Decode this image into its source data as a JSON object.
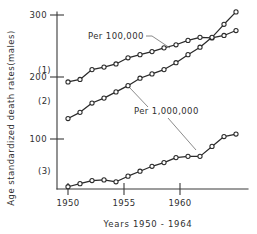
{
  "chart_data": {
    "type": "line",
    "title": "",
    "xlabel": "Years  1950 - 1964",
    "ylabel": "Age standardized death rates(males)",
    "xlim": [
      1949.3,
      1964.8
    ],
    "ylim": [
      0,
      315
    ],
    "xticks": [
      1950,
      1955,
      1960
    ],
    "xtick_labels": [
      "1950",
      "1955",
      "1960"
    ],
    "yticks": [
      100,
      200,
      300
    ],
    "ytick_labels": [
      "100",
      "200",
      "300"
    ],
    "grid": false,
    "legend": "none",
    "marker": "open-circle",
    "x": [
      1950,
      1951,
      1952,
      1953,
      1954,
      1955,
      1956,
      1957,
      1958,
      1959,
      1960,
      1961,
      1962,
      1963,
      1964
    ],
    "series": [
      {
        "name": "(1)",
        "label": "(1)",
        "units_annotation": "Per 100,000",
        "values": [
          192,
          196,
          212,
          216,
          221,
          231,
          236,
          241,
          247,
          252,
          259,
          264,
          263,
          267,
          275
        ]
      },
      {
        "name": "(2)",
        "label": "(2)",
        "units_annotation": "Per 1,000,000",
        "values": [
          133,
          143,
          158,
          166,
          176,
          186,
          198,
          205,
          212,
          223,
          236,
          248,
          264,
          285,
          305
        ]
      },
      {
        "name": "(3)",
        "label": "(3)",
        "units_annotation": "Per 1,000,000",
        "values": [
          23,
          28,
          33,
          34,
          31,
          40,
          48,
          56,
          62,
          70,
          72,
          72,
          88,
          104,
          108
        ]
      }
    ],
    "annotations": [
      {
        "text": "Per 100,000",
        "points_to": "(1)"
      },
      {
        "text": "Per 1,000,000",
        "points_to": "(2) and (3)"
      }
    ]
  },
  "axes": {
    "y_title": "Age standardized death rates(males)",
    "x_title": "Years  1950 - 1964"
  },
  "labels": {
    "series_1": "(1)",
    "series_2": "(2)",
    "series_3": "(3)",
    "anno_per_100000": "Per 100,000",
    "anno_per_1000000": "Per 1,000,000",
    "ytick_300": "300",
    "ytick_200": "200",
    "ytick_100": "100",
    "xtick_1950": "1950",
    "xtick_1955": "1955",
    "xtick_1960": "1960"
  }
}
